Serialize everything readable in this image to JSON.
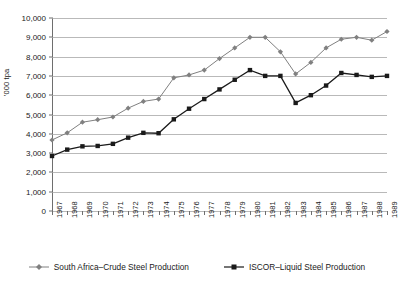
{
  "chart_data": {
    "type": "line",
    "title": "",
    "xlabel": "",
    "ylabel": "'000 tpa",
    "ylim": [
      0,
      10000
    ],
    "ytick_labels": [
      "0",
      "1,000",
      "2,000",
      "3,000",
      "4,000",
      "5,000",
      "6,000",
      "7,000",
      "8,000",
      "9,000",
      "10,000"
    ],
    "ytick_values": [
      0,
      1000,
      2000,
      3000,
      4000,
      5000,
      6000,
      7000,
      8000,
      9000,
      10000
    ],
    "grid": true,
    "legend_position": "bottom",
    "categories": [
      "1967",
      "1968",
      "1969",
      "1970",
      "1971",
      "1972",
      "1973",
      "1974",
      "1975",
      "1976",
      "1977",
      "1978",
      "1979",
      "1980",
      "1981",
      "1982",
      "1983",
      "1984",
      "1985",
      "1986",
      "1987",
      "1988",
      "1989"
    ],
    "series": [
      {
        "name": "South Africa–Crude Steel Production",
        "color": "#808080",
        "marker": "diamond",
        "values": [
          3680,
          4050,
          4600,
          4730,
          4870,
          5330,
          5680,
          5800,
          6900,
          7050,
          7300,
          7900,
          8450,
          9000,
          9000,
          8250,
          7100,
          7700,
          8450,
          8900,
          9000,
          8850,
          9300
        ]
      },
      {
        "name": "ISCOR–Liquid Steel Production",
        "color": "#1a1a1a",
        "marker": "square",
        "values": [
          2850,
          3180,
          3350,
          3370,
          3480,
          3800,
          4050,
          4030,
          4750,
          5300,
          5800,
          6300,
          6800,
          7300,
          7000,
          7000,
          5600,
          6000,
          6500,
          7150,
          7050,
          6950,
          7000
        ]
      }
    ]
  },
  "legend": {
    "items": [
      {
        "label": "South Africa–Crude Steel Production"
      },
      {
        "label": "ISCOR–Liquid Steel Production"
      }
    ]
  }
}
